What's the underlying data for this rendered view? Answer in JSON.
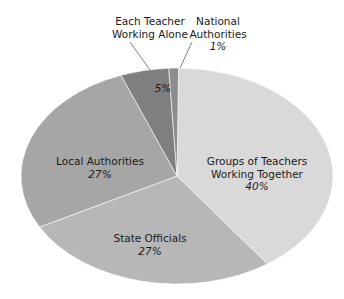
{
  "chart_data": {
    "type": "pie",
    "title": "",
    "slices": [
      {
        "label": "Groups of Teachers Working Together",
        "value": 40,
        "pct_label": "40%",
        "color": "#d9d9d9"
      },
      {
        "label": "State Officials",
        "value": 27,
        "pct_label": "27%",
        "color": "#b7b7b7"
      },
      {
        "label": "Local Authorities",
        "value": 27,
        "pct_label": "27%",
        "color": "#a6a6a6"
      },
      {
        "label": "Each Teacher Working Alone",
        "value": 5,
        "pct_label": "5%",
        "color": "#7f7f7f"
      },
      {
        "label": "National Authorities",
        "value": 1,
        "pct_label": "1%",
        "color": "#8c8c8c"
      }
    ],
    "legend": "none (direct labels)"
  },
  "labels": {
    "groups": {
      "line1": "Groups of Teachers",
      "line2": "Working Together",
      "pct": "40%"
    },
    "state": {
      "line1": "State Officials",
      "pct": "27%"
    },
    "local": {
      "line1": "Local Authorities",
      "pct": "27%"
    },
    "each": {
      "line1": "Each Teacher",
      "line2": "Working Alone",
      "pct": "5%"
    },
    "national": {
      "line1": "National",
      "line2": "Authorities",
      "pct": "1%"
    }
  }
}
